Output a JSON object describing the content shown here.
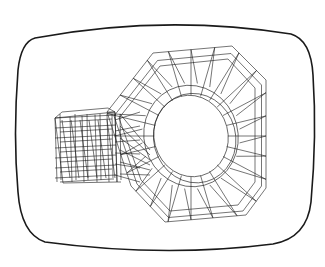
{
  "figure": {
    "background": "#ffffff",
    "stroke": "#1a1a1a",
    "screen_outline": {
      "left": 15,
      "top": 20,
      "right": 313,
      "bottom": 252,
      "stroke_width": 1.6
    },
    "part": {
      "octagon_outer": [
        [
          153,
          53
        ],
        [
          232,
          46
        ],
        [
          266,
          80
        ],
        [
          266,
          188
        ],
        [
          246,
          215
        ],
        [
          165,
          222
        ],
        [
          131,
          186
        ],
        [
          107,
          112
        ]
      ],
      "octagon_inner_ring": [
        [
          160,
          66
        ],
        [
          228,
          59
        ],
        [
          255,
          88
        ],
        [
          255,
          182
        ],
        [
          238,
          205
        ],
        [
          170,
          211
        ],
        [
          141,
          180
        ],
        [
          119,
          118
        ]
      ],
      "hole": {
        "cx": 191,
        "cy": 136,
        "rx": 37,
        "ry": 41
      },
      "hole_ring2": {
        "cx": 191,
        "cy": 136,
        "rx": 47,
        "ry": 51
      },
      "extension": {
        "front": [
          [
            55,
            118
          ],
          [
            115,
            112
          ],
          [
            117,
            182
          ],
          [
            63,
            183
          ]
        ],
        "back": [
          [
            62,
            112
          ],
          [
            108,
            108
          ]
        ],
        "columns_x": [
          55,
          70,
          82,
          95,
          107,
          115
        ],
        "rows_y": [
          118,
          128,
          138,
          148,
          158,
          168,
          178
        ]
      }
    }
  }
}
